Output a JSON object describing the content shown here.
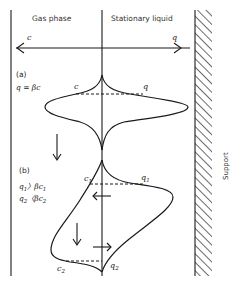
{
  "headers": {
    "gas_phase": "Gas phase",
    "stationary_liquid": "Stationary liquid"
  },
  "axis": {
    "left_label": "c",
    "right_label": "q"
  },
  "panel_a": {
    "tag": "(a)",
    "equation": "q = βc",
    "left_point_label": "c",
    "right_point_label": "q"
  },
  "panel_b": {
    "tag": "(b)",
    "condition_1": {
      "left": "q",
      "left_sub": "1",
      "op": "〉βc",
      "right_sub": "1"
    },
    "condition_2": {
      "left": "q",
      "left_sub": "2",
      "op": "〈βc",
      "right_sub": "2"
    },
    "point_labels": {
      "c1": {
        "base": "c",
        "sub": "1"
      },
      "q1": {
        "base": "q",
        "sub": "1"
      },
      "c2": {
        "base": "c",
        "sub": "2"
      },
      "q2": {
        "base": "q",
        "sub": "2"
      }
    }
  },
  "support_label": "Support",
  "colors": {
    "ink": "#1a1a1a",
    "background": "#ffffff"
  }
}
